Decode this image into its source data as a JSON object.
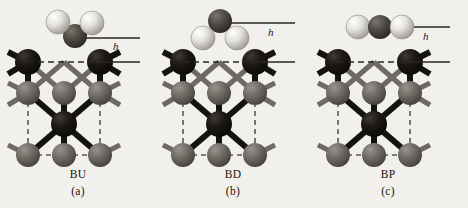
{
  "figure": {
    "background_color": "#f2f0ec",
    "panel_count": 3
  },
  "panels": [
    {
      "id": "a",
      "config_label": "BU",
      "index_label": "(a)",
      "height_symbol": "h",
      "molecule": {
        "orientation": "bent-up",
        "atoms": [
          {
            "role": "terminal",
            "shade": "light",
            "cx": 58,
            "cy": 22,
            "r": 12
          },
          {
            "role": "terminal",
            "shade": "light",
            "cx": 92,
            "cy": 23,
            "r": 12
          },
          {
            "role": "center",
            "shade": "dark",
            "cx": 75,
            "cy": 36,
            "r": 12
          }
        ],
        "reference_line_y": 38
      }
    },
    {
      "id": "b",
      "config_label": "BD",
      "index_label": "(b)",
      "height_symbol": "h",
      "molecule": {
        "orientation": "bent-down",
        "atoms": [
          {
            "role": "center",
            "shade": "dark",
            "cx": 65,
            "cy": 21,
            "r": 12
          },
          {
            "role": "terminal",
            "shade": "light",
            "cx": 48,
            "cy": 38,
            "r": 12
          },
          {
            "role": "terminal",
            "shade": "light",
            "cx": 82,
            "cy": 38,
            "r": 12
          }
        ],
        "reference_line_y": 23
      }
    },
    {
      "id": "c",
      "config_label": "BP",
      "index_label": "(c)",
      "height_symbol": "h",
      "molecule": {
        "orientation": "parallel",
        "atoms": [
          {
            "role": "terminal",
            "shade": "light",
            "cx": 48,
            "cy": 27,
            "r": 12
          },
          {
            "role": "center",
            "shade": "dark",
            "cx": 70,
            "cy": 27,
            "r": 12
          },
          {
            "role": "terminal",
            "shade": "light",
            "cx": 92,
            "cy": 27,
            "r": 12
          }
        ],
        "reference_line_y": 27
      }
    }
  ],
  "lattice": {
    "surface_line_y": 62,
    "atoms": [
      {
        "layer": "surface",
        "shade": "black",
        "cx": 28,
        "cy": 62,
        "r": 13
      },
      {
        "layer": "surface",
        "shade": "black",
        "cx": 100,
        "cy": 62,
        "r": 13
      },
      {
        "layer": "second",
        "shade": "gray",
        "cx": 28,
        "cy": 93,
        "r": 12
      },
      {
        "layer": "second",
        "shade": "gray",
        "cx": 64,
        "cy": 93,
        "r": 12
      },
      {
        "layer": "second",
        "shade": "gray",
        "cx": 100,
        "cy": 93,
        "r": 12
      },
      {
        "layer": "third",
        "shade": "black",
        "cx": 64,
        "cy": 124,
        "r": 13
      },
      {
        "layer": "fourth",
        "shade": "gray",
        "cx": 28,
        "cy": 155,
        "r": 12
      },
      {
        "layer": "fourth",
        "shade": "gray",
        "cx": 64,
        "cy": 155,
        "r": 12
      },
      {
        "layer": "fourth",
        "shade": "gray",
        "cx": 100,
        "cy": 155,
        "r": 12
      }
    ]
  },
  "colors": {
    "background": "#f2f0ec",
    "atom_light": "#e8e6e2",
    "atom_light_edge": "#9a978f",
    "atom_dark": "#4a4641",
    "atom_black": "#151310",
    "atom_gray": "#6d6a64",
    "bond_black": "#151310",
    "bond_gray": "#6d6a64",
    "guide_line": "#2a2723",
    "text": "#17140f"
  }
}
